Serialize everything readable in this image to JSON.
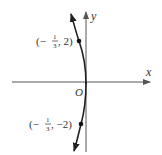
{
  "diagram": {
    "type": "function-graph",
    "axes": {
      "x_label": "x",
      "y_label": "y",
      "origin_label": "O"
    },
    "curve": {
      "description": "curve through origin, opening to the left, arrows at both ends",
      "color": "#222222"
    },
    "points": [
      {
        "label_prefix": "(−",
        "frac_num": "1",
        "frac_den": "3",
        "label_suffix": ", 2)",
        "x": "-1/3",
        "y": "2"
      },
      {
        "label_prefix": "(−",
        "frac_num": "1",
        "frac_den": "3",
        "label_suffix": ", −2)",
        "x": "-1/3",
        "y": "-2"
      }
    ],
    "colors": {
      "axis": "#555555",
      "curve": "#222222",
      "text": "#333333"
    }
  }
}
